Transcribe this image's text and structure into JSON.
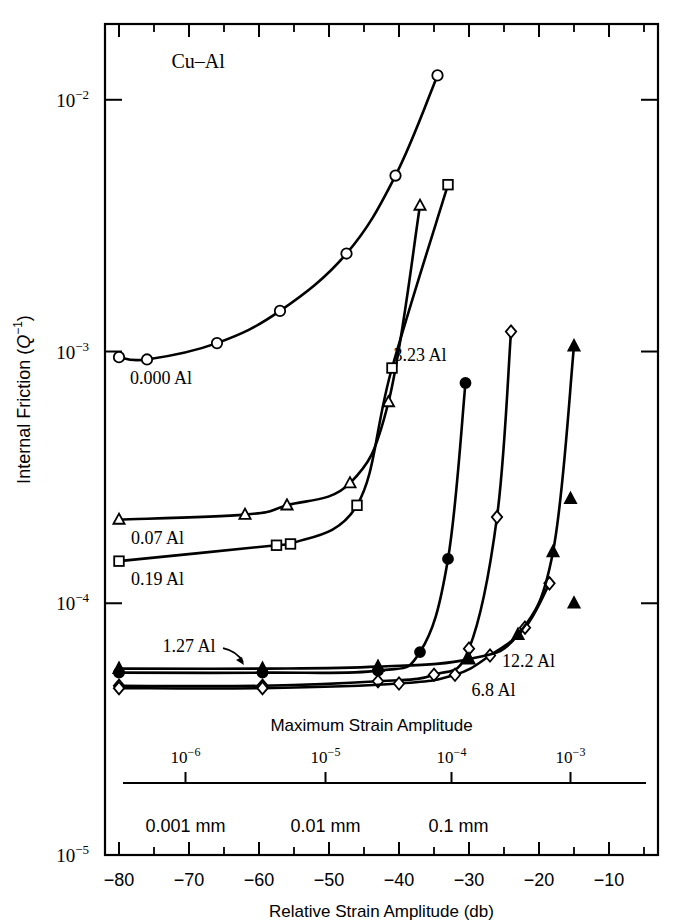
{
  "figure": {
    "title_in_plot": "Cu–Al",
    "background": "#ffffff",
    "ink": "#000000"
  },
  "axes": {
    "y": {
      "label_prefix": "Internal Friction (",
      "label_italic": "Q",
      "label_exponent": "−1",
      "label_suffix": ")",
      "ticks": [
        "10",
        "10",
        "10",
        "10"
      ],
      "tick_exponents": [
        "−2",
        "−3",
        "−4",
        "−5"
      ],
      "base": "10",
      "range_decades": [
        -5,
        -2
      ]
    },
    "x_primary": {
      "label": "Relative Strain Amplitude (db)",
      "ticks": [
        "−80",
        "−70",
        "−60",
        "−50",
        "−40",
        "−30",
        "−20",
        "−10"
      ],
      "tick_values": [
        -80,
        -70,
        -60,
        -50,
        -40,
        -30,
        -20,
        -10
      ],
      "range": [
        -82,
        -3
      ]
    },
    "x_secondary": {
      "label": "Maximum Strain Amplitude",
      "ticks": [
        "10",
        "10",
        "10",
        "10"
      ],
      "tick_exponents": [
        "−6",
        "−5",
        "−4",
        "−3"
      ],
      "tick_db_positions": [
        -70.5,
        -50.5,
        -32.5,
        -15.5
      ]
    },
    "x_tertiary": {
      "ticks": [
        "0.001 mm",
        "0.01 mm",
        "0.1 mm"
      ],
      "tick_db_positions": [
        -70.5,
        -50.5,
        -31.5
      ]
    }
  },
  "chart_data": {
    "type": "line",
    "title": "Cu–Al",
    "xlabel": "Relative Strain Amplitude (db)",
    "ylabel": "Internal Friction (Q−1)",
    "xlim": [
      -82,
      -3
    ],
    "ylim": [
      1e-05,
      0.02
    ],
    "yscale": "log",
    "grid": false,
    "legend": "inline-annotations",
    "series": [
      {
        "name": "0.000 Al",
        "label": "0.000 Al",
        "marker": "open-circle",
        "x": [
          -80.0,
          -76.0,
          -66.0,
          -57.0,
          -47.5,
          -40.5,
          -34.5
        ],
        "y": [
          0.00095,
          0.00093,
          0.00108,
          0.00145,
          0.00245,
          0.005,
          0.0125
        ],
        "label_pos": {
          "x": -74.0,
          "y": 0.00074
        }
      },
      {
        "name": "0.07 Al",
        "label": "0.07 Al",
        "marker": "open-triangle",
        "x": [
          -80.0,
          -62.0,
          -56.0,
          -47.0,
          -41.5,
          -37.0
        ],
        "y": [
          0.000215,
          0.000225,
          0.000245,
          0.0003,
          0.00063,
          0.0038
        ],
        "label_pos": {
          "x": -74.5,
          "y": 0.000172
        }
      },
      {
        "name": "0.19 Al",
        "label": "0.19 Al",
        "marker": "open-square",
        "x": [
          -80.0,
          -57.5,
          -55.5,
          -46.0,
          -41.0,
          -33.0
        ],
        "y": [
          0.000147,
          0.00017,
          0.000172,
          0.000245,
          0.00086,
          0.0046
        ],
        "label_pos": {
          "x": -74.5,
          "y": 0.000118
        }
      },
      {
        "name": "1.27 Al",
        "label": "1.27 Al",
        "marker": "filled-circle",
        "x": [
          -80.0,
          -59.5,
          -43.0,
          -37.0,
          -33.0,
          -30.5
        ],
        "y": [
          5.3e-05,
          5.3e-05,
          5.4e-05,
          6.4e-05,
          0.00015,
          0.00075
        ],
        "label_pos": {
          "x": -70.0,
          "y": 6.4e-05
        },
        "annotation_arrow": true
      },
      {
        "name": "3.23 Al",
        "label": "3.23 Al",
        "marker": "open-diamond",
        "x": [
          -80.0,
          -59.5,
          -43.0,
          -35.0,
          -30.0,
          -26.0,
          -24.0
        ],
        "y": [
          4.7e-05,
          4.7e-05,
          4.9e-05,
          5.2e-05,
          6.6e-05,
          0.00022,
          0.0012
        ],
        "label_pos": {
          "x": -37.0,
          "y": 0.00092
        }
      },
      {
        "name": "6.8 Al",
        "label": "6.8 Al",
        "marker": "open-diamond",
        "x": [
          -80.0,
          -59.5,
          -40.0,
          -32.0,
          -27.0,
          -22.0,
          -18.5
        ],
        "y": [
          4.6e-05,
          4.6e-05,
          4.8e-05,
          5.2e-05,
          6.2e-05,
          8e-05,
          0.00012
        ],
        "label_pos": {
          "x": -26.5,
          "y": 4.3e-05
        }
      },
      {
        "name": "12.2 Al",
        "label": "12.2 Al",
        "marker": "filled-triangle",
        "x": [
          -80.0,
          -59.5,
          -43.0,
          -30.0,
          -23.0,
          -18.0,
          -15.0
        ],
        "y": [
          5.5e-05,
          5.5e-05,
          5.6e-05,
          6e-05,
          7.5e-05,
          0.00016,
          0.00105
        ],
        "extra_markers": [
          {
            "x": -15.0,
            "y": 0.0001
          },
          {
            "x": -15.5,
            "y": 0.00026
          }
        ],
        "label_pos": {
          "x": -21.5,
          "y": 5.6e-05
        }
      }
    ]
  }
}
